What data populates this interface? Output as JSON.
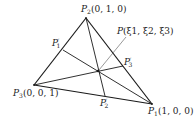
{
  "diagram": {
    "type": "triangle-cevians",
    "vertices": {
      "P1": {
        "label_name": "P",
        "label_sub": "1",
        "coords": "(1, 0, 0)",
        "x": 152,
        "y": 104
      },
      "P2": {
        "label_name": "P",
        "label_sub": "2",
        "coords": "(0, 1, 0)",
        "x": 86,
        "y": 18
      },
      "P3": {
        "label_name": "P",
        "label_sub": "3",
        "coords": "(0, 0, 1)",
        "x": 34,
        "y": 85
      }
    },
    "interior_point": {
      "label_name": "P",
      "coords": "(ξ1, ξ2, ξ3)",
      "x": 98,
      "y": 71
    },
    "feet": {
      "P1p": {
        "label_name": "P",
        "label_sub": "1",
        "label_sup": "′",
        "x": 63,
        "y": 50
      },
      "P2p": {
        "label_name": "P",
        "label_sub": "2",
        "label_sup": "′",
        "x": 105,
        "y": 96
      },
      "P3p": {
        "label_name": "P",
        "label_sub": "3",
        "label_sup": "′",
        "x": 123,
        "y": 66
      }
    },
    "colors": {
      "line": "#1a1a1a",
      "text": "#222222",
      "background": "#ffffff"
    }
  }
}
